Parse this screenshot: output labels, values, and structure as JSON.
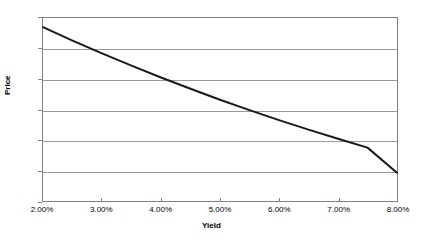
{
  "chart_data": {
    "type": "line",
    "title": "",
    "xlabel": "Yield",
    "ylabel": "Price",
    "xlim": [
      0.02,
      0.08
    ],
    "ylim": [
      70,
      130
    ],
    "grid": true,
    "legend": "none",
    "x_tick_labels": [
      "2.00%",
      "3.00%",
      "4.00%",
      "5.00%",
      "6.00%",
      "7.00%",
      "8.00%"
    ],
    "x_tick_values": [
      0.02,
      0.03,
      0.04,
      0.05,
      0.06,
      0.07,
      0.08
    ],
    "y_tick_labels": [
      "70",
      "80",
      "90",
      "100",
      "110",
      "120",
      "130"
    ],
    "y_tick_values": [
      70,
      80,
      90,
      100,
      110,
      120,
      130
    ],
    "series": [
      {
        "name": "Price",
        "color": "#1a1a1a",
        "x": [
          0.02,
          0.025,
          0.03,
          0.035,
          0.04,
          0.045,
          0.05,
          0.055,
          0.06,
          0.065,
          0.07,
          0.075,
          0.08
        ],
        "values": [
          127.0,
          122.6,
          118.4,
          114.4,
          110.5,
          106.8,
          103.2,
          99.8,
          96.5,
          93.4,
          90.4,
          87.5,
          79.3
        ]
      }
    ],
    "annotations": []
  },
  "axis": {
    "y_title": "Price",
    "x_title": "Yield"
  }
}
